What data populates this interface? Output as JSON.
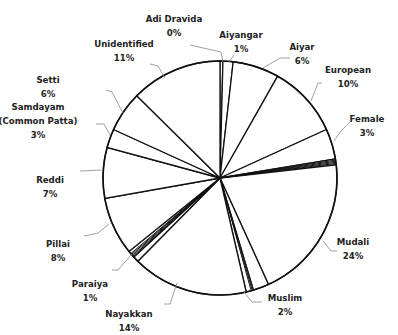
{
  "chart_data": {
    "type": "pie",
    "title": "",
    "start_angle_deg": 0,
    "direction": "clockwise",
    "center": [
      220,
      178
    ],
    "radius": 117,
    "slices": [
      {
        "label": "Adi Dravida",
        "value": 0.4,
        "pct_label": "0%",
        "label_lines": [
          "Adi Dravida",
          "0%"
        ],
        "label_pos": [
          174,
          22
        ],
        "leader": [
          [
            223,
            62
          ],
          [
            221,
            52
          ],
          [
            190,
            45
          ]
        ]
      },
      {
        "label": "Aiyangar",
        "value": 1.4,
        "pct_label": "1%",
        "label_lines": [
          "Aiyangar",
          "1%"
        ],
        "label_pos": [
          241,
          38
        ],
        "leader": [
          [
            229,
            62
          ],
          [
            234,
            55
          ]
        ]
      },
      {
        "label": "Aiyar",
        "value": 6.4,
        "pct_label": "6%",
        "label_lines": [
          "Aiyar",
          "6%"
        ],
        "label_pos": [
          302,
          50
        ],
        "leader": [
          [
            263,
            68
          ],
          [
            280,
            58
          ],
          [
            290,
            58
          ]
        ]
      },
      {
        "label": "European",
        "value": 10,
        "pct_label": "10%",
        "label_lines": [
          "European",
          "10%"
        ],
        "label_pos": [
          348,
          73
        ],
        "leader": [
          [
            311,
            101
          ],
          [
            318,
            83
          ],
          [
            322,
            83
          ]
        ]
      },
      {
        "label": "Female",
        "value": 4.2,
        "pct_label": "3%",
        "label_lines": [
          "Female",
          "3%"
        ],
        "label_pos": [
          367,
          122
        ],
        "leader": [
          [
            334,
            141
          ],
          [
            341,
            131
          ],
          [
            350,
            122
          ]
        ]
      },
      {
        "label": "",
        "value": 0.8,
        "pct_label": "",
        "label_lines": []
      },
      {
        "label": "Mudali",
        "value": 20,
        "pct_label": "24%",
        "label_lines": [
          "Mudali",
          "24%"
        ],
        "label_pos": [
          353,
          245
        ],
        "leader": [
          [
            323,
            241
          ],
          [
            331,
            251
          ],
          [
            337,
            251
          ]
        ]
      },
      {
        "label": "Muslim",
        "value": 2.2,
        "pct_label": "2%",
        "label_lines": [
          "Muslim",
          "2%"
        ],
        "label_pos": [
          285,
          301
        ],
        "leader": [
          [
            244,
            292
          ],
          [
            252,
            302
          ],
          [
            262,
            302
          ]
        ]
      },
      {
        "label": "",
        "value": 1.0,
        "pct_label": "",
        "label_lines": []
      },
      {
        "label": "Nayakkan",
        "value": 16,
        "pct_label": "14%",
        "label_lines": [
          "Nayakkan",
          "14%"
        ],
        "label_pos": [
          129,
          317
        ],
        "leader": [
          [
            177,
            283
          ],
          [
            170,
            304
          ],
          [
            164,
            304
          ]
        ]
      },
      {
        "label": "Paraiya",
        "value": 0.8,
        "pct_label": "1%",
        "label_lines": [
          "Paraiya",
          "1%"
        ],
        "label_pos": [
          90,
          287
        ],
        "leader": [
          [
            132,
            254
          ],
          [
            118,
            270
          ],
          [
            112,
            270
          ]
        ]
      },
      {
        "label": "",
        "value": 1.0,
        "pct_label": "",
        "label_lines": []
      },
      {
        "label": "Pillai",
        "value": 8,
        "pct_label": "8%",
        "label_lines": [
          "Pillai",
          "8%"
        ],
        "label_pos": [
          58,
          247
        ],
        "leader": [
          [
            109,
            224
          ],
          [
            98,
            233
          ],
          [
            84,
            236
          ]
        ]
      },
      {
        "label": "Reddi",
        "value": 7,
        "pct_label": "7%",
        "label_lines": [
          "Reddi",
          "7%"
        ],
        "label_pos": [
          50,
          183
        ],
        "leader": [
          [
            101,
            170
          ],
          [
            80,
            171
          ]
        ]
      },
      {
        "label": "Samdayam (Common Patta)",
        "value": 2.6,
        "pct_label": "3%",
        "label_lines": [
          "Samdayam",
          "(Common Patta)",
          "3%"
        ],
        "label_pos": [
          38,
          110
        ],
        "leader": [
          [
            110,
            135
          ],
          [
            104,
            124
          ],
          [
            96,
            124
          ]
        ]
      },
      {
        "label": "Setti",
        "value": 5.6,
        "pct_label": "6%",
        "label_lines": [
          "Setti",
          "6%"
        ],
        "label_pos": [
          48,
          83
        ],
        "leader": [
          [
            123,
            113
          ],
          [
            112,
            92
          ],
          [
            106,
            90
          ]
        ]
      },
      {
        "label": "Unidentified",
        "value": 12.6,
        "pct_label": "11%",
        "label_lines": [
          "Unidentified",
          "11%"
        ],
        "label_pos": [
          124,
          47
        ],
        "leader": [
          [
            165,
            78
          ],
          [
            158,
            66
          ],
          [
            150,
            64
          ]
        ]
      }
    ],
    "thin_slice_groups": [
      {
        "after": "Female",
        "count": 4
      },
      {
        "after": "Muslim",
        "count": 2
      },
      {
        "after": "Paraiya",
        "count": 4
      }
    ],
    "legend": "none",
    "grid": false,
    "colors": {
      "fill": "#ffffff",
      "stroke": "#111111",
      "leader": "#888888",
      "text": "#222222"
    }
  }
}
